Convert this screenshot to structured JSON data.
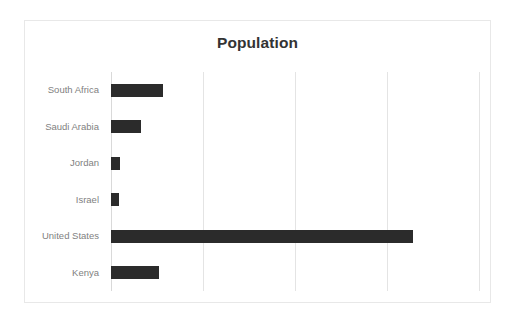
{
  "chart": {
    "title": "Population",
    "frame_border_color": "#e8e8e8",
    "background_color": "#ffffff",
    "bar_color": "#2b2b2b",
    "gridline_color": "#e4e4e4",
    "label_color": "#7f7f7f",
    "title_color": "#333333"
  },
  "chart_data": {
    "type": "bar",
    "orientation": "horizontal",
    "title": "Population",
    "xlabel": "",
    "ylabel": "",
    "categories": [
      "South Africa",
      "Saudi Arabia",
      "Jordan",
      "Israel",
      "United States",
      "Kenya"
    ],
    "values": [
      56,
      33,
      10,
      9,
      328,
      52
    ],
    "value_unit": "millions",
    "xlim": [
      0,
      400
    ],
    "xticks": [
      0,
      100,
      200,
      300,
      400
    ],
    "xtick_labels": [
      "",
      "",
      "",
      "",
      ""
    ],
    "grid": true,
    "grid_axis": "x",
    "legend": false,
    "series": [
      {
        "name": "Population",
        "values": [
          56,
          33,
          10,
          9,
          328,
          52
        ]
      }
    ]
  }
}
